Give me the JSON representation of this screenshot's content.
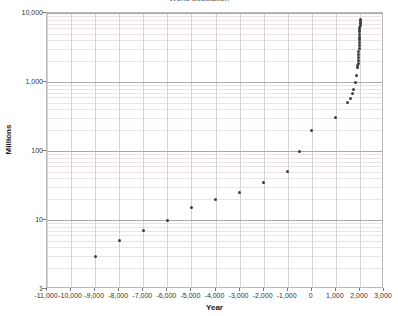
{
  "chart_data": {
    "type": "scatter",
    "title": "World population",
    "xlabel": "Year",
    "ylabel": "Millions",
    "xlim": [
      -11000,
      3000
    ],
    "ylim": [
      1,
      10000
    ],
    "yscale": "log",
    "xscale": "linear",
    "grid": true,
    "legend": "none",
    "marker_color": "#3d3d3d",
    "x_ticks": [
      "-11,000",
      "-10,000",
      "-9,000",
      "-8,000",
      "-7,000",
      "-6,000",
      "-5,000",
      "-4,000",
      "-3,000",
      "-2,000",
      "-1,000",
      "0",
      "1,000",
      "2,000",
      "3,000"
    ],
    "x_tick_values": [
      -11000,
      -10000,
      -9000,
      -8000,
      -7000,
      -6000,
      -5000,
      -4000,
      -3000,
      -2000,
      -1000,
      0,
      1000,
      2000,
      3000
    ],
    "y_ticks": [
      "1",
      "10",
      "100",
      "1,000",
      "10,000"
    ],
    "y_tick_values": [
      1,
      10,
      100,
      1000,
      10000
    ],
    "series": [
      {
        "name": "World population",
        "points": [
          [
            -10000,
            1
          ],
          [
            -9000,
            3
          ],
          [
            -8000,
            5
          ],
          [
            -7000,
            7
          ],
          [
            -6000,
            10
          ],
          [
            -5000,
            15
          ],
          [
            -4000,
            20
          ],
          [
            -3000,
            25
          ],
          [
            -2000,
            35
          ],
          [
            -1000,
            50
          ],
          [
            -500,
            100
          ],
          [
            1,
            200
          ],
          [
            1000,
            310
          ],
          [
            1500,
            500
          ],
          [
            1600,
            580
          ],
          [
            1700,
            680
          ],
          [
            1750,
            790
          ],
          [
            1800,
            980
          ],
          [
            1850,
            1260
          ],
          [
            1900,
            1650
          ],
          [
            1910,
            1750
          ],
          [
            1920,
            1860
          ],
          [
            1930,
            2070
          ],
          [
            1940,
            2300
          ],
          [
            1950,
            2536
          ],
          [
            1955,
            2773
          ],
          [
            1960,
            3035
          ],
          [
            1965,
            3340
          ],
          [
            1970,
            3700
          ],
          [
            1975,
            4079
          ],
          [
            1980,
            4458
          ],
          [
            1985,
            4871
          ],
          [
            1990,
            5327
          ],
          [
            1995,
            5744
          ],
          [
            2000,
            6143
          ],
          [
            2005,
            6542
          ],
          [
            2010,
            6957
          ],
          [
            2015,
            7380
          ],
          [
            2020,
            7795
          ],
          [
            2025,
            8100
          ]
        ]
      }
    ]
  }
}
